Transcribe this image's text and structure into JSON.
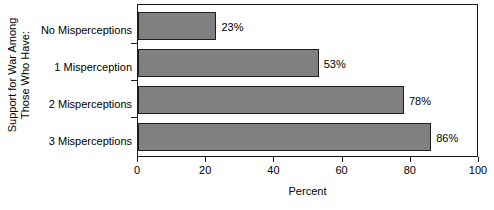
{
  "chart_data": {
    "type": "bar",
    "orientation": "horizontal",
    "title": "",
    "categories": [
      "No Misperceptions",
      "1 Misperception",
      "2 Misperceptions",
      "3 Misperceptions"
    ],
    "values": [
      23,
      53,
      78,
      86
    ],
    "value_labels": [
      "23%",
      "53%",
      "78%",
      "86%"
    ],
    "xlabel": "Percent",
    "ylabel": "Support for War Among Those Who Have:",
    "ylabel_lines": [
      "Support for War Among",
      "Those Who Have:"
    ],
    "xlim": [
      0,
      100
    ],
    "xticks": [
      0,
      20,
      40,
      60,
      80,
      100
    ],
    "xtick_labels": [
      "0",
      "20",
      "40",
      "60",
      "80",
      "100"
    ],
    "grid": false,
    "legend": null,
    "bar_color": "#808080",
    "bar_border_color": "#1f1f1f",
    "axis_color": "#1a1a1a",
    "background": "#ffffff"
  }
}
